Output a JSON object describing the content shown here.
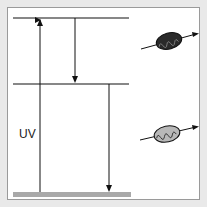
{
  "diagram": {
    "type": "energy-level (Jablonski) diagram",
    "label_uv": "UV",
    "levels": [
      {
        "name": "upper-level",
        "y": 18
      },
      {
        "name": "middle-level",
        "y": 84
      },
      {
        "name": "ground-state",
        "y": 194
      }
    ],
    "arrows": [
      {
        "name": "uv-absorption-arrow",
        "direction": "up"
      },
      {
        "name": "upper-to-middle-arrow",
        "direction": "down"
      },
      {
        "name": "middle-to-ground-arrow",
        "direction": "down"
      }
    ],
    "photon_icons": [
      {
        "name": "dark-photon-icon",
        "fill": "#2a2a2a"
      },
      {
        "name": "light-photon-icon",
        "fill": "#b8b8b8"
      }
    ],
    "colors": {
      "ground_bar": "#a9a9a9",
      "line": "#111111",
      "frame_border": "#9a9a9a",
      "background": "#e9e9e9"
    }
  }
}
